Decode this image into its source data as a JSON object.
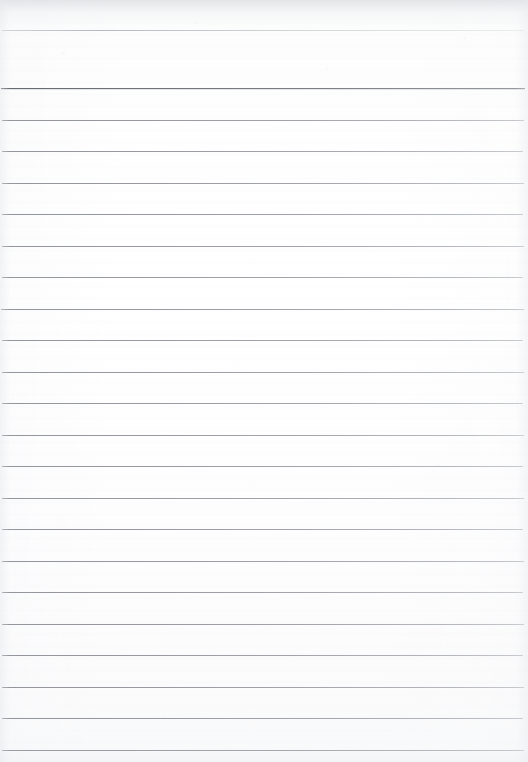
{
  "document": {
    "kind": "lined-notebook-paper",
    "title": "Blank ruled notebook page",
    "description": "A scanned sheet of blank lined writing paper with horizontal ruled lines and no handwritten or printed content.",
    "content_text": "",
    "page_width": 528,
    "page_height": 762,
    "paper_color": "#fdfdfe",
    "rule_color": "#8d9196",
    "has_margin_rule": false,
    "has_header": false,
    "has_page_number": false,
    "written_content": "none"
  },
  "ruling": {
    "style": "wide-ruled horizontal lines",
    "line_count": 23,
    "line_spacing_px": 31.5,
    "first_line_y": 30,
    "last_line_y": 750,
    "line_inset_left_px": 2,
    "line_inset_right_px": 4,
    "lines": [
      {
        "y": 30,
        "weight": "faint",
        "left": 2,
        "right": 4
      },
      {
        "y": 88,
        "weight": "heavy",
        "left": 1,
        "right": 3
      },
      {
        "y": 120,
        "weight": "normal",
        "left": 2,
        "right": 4
      },
      {
        "y": 151,
        "weight": "normal",
        "left": 2,
        "right": 5
      },
      {
        "y": 183,
        "weight": "normal",
        "left": 2,
        "right": 4
      },
      {
        "y": 214,
        "weight": "normal",
        "left": 2,
        "right": 5
      },
      {
        "y": 246,
        "weight": "normal",
        "left": 2,
        "right": 4
      },
      {
        "y": 277,
        "weight": "normal",
        "left": 2,
        "right": 5
      },
      {
        "y": 309,
        "weight": "normal",
        "left": 1,
        "right": 4
      },
      {
        "y": 340,
        "weight": "normal",
        "left": 2,
        "right": 5
      },
      {
        "y": 372,
        "weight": "normal",
        "left": 2,
        "right": 4
      },
      {
        "y": 403,
        "weight": "normal",
        "left": 2,
        "right": 5
      },
      {
        "y": 435,
        "weight": "normal",
        "left": 2,
        "right": 4
      },
      {
        "y": 466,
        "weight": "normal",
        "left": 2,
        "right": 5
      },
      {
        "y": 498,
        "weight": "normal",
        "left": 2,
        "right": 4
      },
      {
        "y": 529,
        "weight": "normal",
        "left": 2,
        "right": 5
      },
      {
        "y": 561,
        "weight": "normal",
        "left": 2,
        "right": 4
      },
      {
        "y": 592,
        "weight": "normal",
        "left": 2,
        "right": 5
      },
      {
        "y": 624,
        "weight": "normal",
        "left": 2,
        "right": 4
      },
      {
        "y": 655,
        "weight": "normal",
        "left": 2,
        "right": 5
      },
      {
        "y": 687,
        "weight": "normal",
        "left": 2,
        "right": 4
      },
      {
        "y": 718,
        "weight": "normal",
        "left": 2,
        "right": 5
      },
      {
        "y": 750,
        "weight": "normal",
        "left": 2,
        "right": 4
      }
    ]
  }
}
